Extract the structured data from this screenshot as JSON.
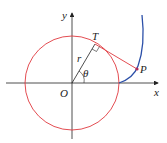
{
  "diagram": {
    "labels": {
      "x_axis": "x",
      "y_axis": "y",
      "origin": "O",
      "tangent_point": "T",
      "point": "P",
      "radius": "r",
      "angle": "θ"
    },
    "colors": {
      "circle": "#e0393e",
      "tangent_segment": "#e0393e",
      "involute_curve": "#2b4fa8",
      "axes": "#222222",
      "point": "#b02a5a"
    }
  }
}
